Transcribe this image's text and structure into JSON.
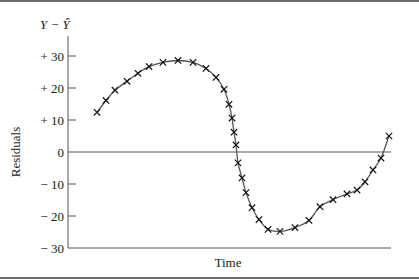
{
  "chart_data": {
    "type": "line",
    "title": "",
    "xlabel": "Time",
    "ylabel": "Residuals",
    "y_axis_top_label": "Y − Ŷ",
    "ylim": [
      -30,
      30
    ],
    "yticks": [
      30,
      20,
      10,
      0,
      -10,
      -20,
      -30
    ],
    "ytick_labels": [
      "+ 30",
      "+ 20",
      "+ 10",
      "0",
      "− 10",
      "− 20",
      "− 30"
    ],
    "grid": false,
    "zero_line": true,
    "marker": "x",
    "series": [
      {
        "name": "Residuals",
        "x": [
          1,
          2,
          3,
          4,
          5,
          6,
          7,
          8,
          9,
          10,
          11,
          12,
          13,
          14,
          15,
          16,
          17,
          18,
          19,
          20,
          21,
          22,
          23,
          24,
          25,
          26,
          27,
          28,
          29,
          30,
          31,
          32,
          33
        ],
        "values": [
          12.4,
          16.1,
          19.3,
          22.1,
          24.6,
          26.7,
          28.0,
          28.6,
          28.0,
          26.1,
          23.3,
          19.6,
          14.9,
          10.6,
          6.2,
          2.2,
          -3.4,
          -8.1,
          -12.7,
          -17.4,
          -21.1,
          -24.2,
          -24.8,
          -23.6,
          -21.4,
          -17.1,
          -14.9,
          -13.1,
          -11.9,
          -9.3,
          -5.6,
          -1.9,
          5.0
        ]
      }
    ]
  },
  "labels": {
    "y_top": "Y − Ŷ",
    "y_axis": "Residuals",
    "x_axis": "Time"
  }
}
